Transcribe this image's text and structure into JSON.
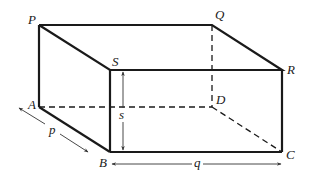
{
  "figure": {
    "type": "rectangular cuboid",
    "vertices": {
      "P": {
        "label": "P",
        "x": 39,
        "y": 25
      },
      "Q": {
        "label": "Q",
        "x": 212,
        "y": 25
      },
      "R": {
        "label": "R",
        "x": 282,
        "y": 70
      },
      "S": {
        "label": "S",
        "x": 110,
        "y": 70
      },
      "A": {
        "label": "A",
        "x": 39,
        "y": 107
      },
      "B": {
        "label": "B",
        "x": 110,
        "y": 152
      },
      "C": {
        "label": "C",
        "x": 282,
        "y": 152
      },
      "D": {
        "label": "D",
        "x": 212,
        "y": 107
      }
    },
    "solid_edges": [
      "PQ",
      "QR",
      "RS",
      "SP",
      "SB",
      "RC",
      "BC",
      "PA",
      "AB"
    ],
    "hidden_edges": [
      "AD",
      "DC",
      "QD"
    ],
    "dimensions": {
      "p": {
        "label": "p",
        "along": "AB"
      },
      "q": {
        "label": "q",
        "along": "BC"
      },
      "s": {
        "label": "s",
        "along": "SB"
      }
    },
    "colors": {
      "line": "#1a1a1a",
      "dim": "#333333",
      "background": "#ffffff"
    }
  }
}
